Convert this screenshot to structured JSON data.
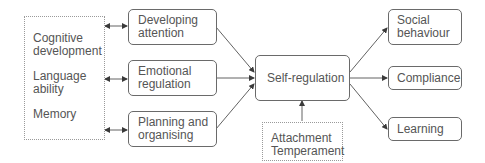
{
  "diagram": {
    "influences": {
      "items": [
        {
          "line1": "Cognitive",
          "line2": "development"
        },
        {
          "line1": "Language",
          "line2": "ability"
        },
        {
          "line1": "Memory",
          "line2": ""
        }
      ]
    },
    "components": [
      {
        "line1": "Developing",
        "line2": "attention"
      },
      {
        "line1": "Emotional",
        "line2": "regulation"
      },
      {
        "line1": "Planning and",
        "line2": "organising"
      }
    ],
    "center": {
      "label": "Self-regulation"
    },
    "moderators": {
      "line1": "Attachment",
      "line2": "Temperament"
    },
    "outcomes": [
      {
        "line1": "Social",
        "line2": "behaviour"
      },
      {
        "line1": "Compliance",
        "line2": ""
      },
      {
        "line1": "Learning",
        "line2": ""
      }
    ],
    "colors": {
      "line": "#3a3a3a",
      "box_border": "#6a6a6a",
      "dotted_border": "#9a9a9a",
      "text": "#555555"
    }
  }
}
